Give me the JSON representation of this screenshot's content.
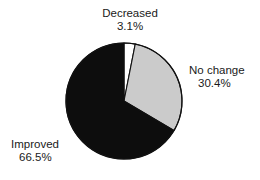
{
  "chart_data": {
    "type": "pie",
    "title": "",
    "categories": [
      "Decreased",
      "No change",
      "Improved"
    ],
    "values": [
      3.1,
      30.4,
      66.5
    ],
    "unit": "%",
    "start_angle_deg": 0,
    "direction": "clockwise",
    "legend": "none",
    "grid": false,
    "slices": [
      {
        "label": "Decreased",
        "value": 3.1,
        "value_text": "3.1%",
        "color": "#ffffff",
        "stroke": "#111111"
      },
      {
        "label": "No change",
        "value": 30.4,
        "value_text": "30.4%",
        "color": "#cbcbcb",
        "stroke": "#111111"
      },
      {
        "label": "Improved",
        "value": 66.5,
        "value_text": "66.5%",
        "color": "#0d0d0d",
        "stroke": "#111111"
      }
    ]
  },
  "labels": {
    "decreased": {
      "name": "Decreased",
      "percent": "3.1%"
    },
    "no_change": {
      "name": "No change",
      "percent": "30.4%"
    },
    "improved": {
      "name": "Improved",
      "percent": "66.5%"
    }
  },
  "colors": {
    "background": "#ffffff",
    "text": "#1a1a1a",
    "outline": "#111111",
    "slice_white": "#ffffff",
    "slice_gray": "#cbcbcb",
    "slice_black": "#0d0d0d"
  },
  "geometry": {
    "center_x": 124,
    "center_y": 101,
    "radius": 58
  }
}
